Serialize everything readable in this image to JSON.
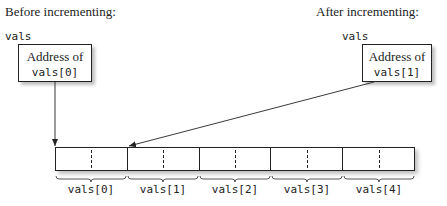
{
  "before": {
    "caption": "Before incrementing:",
    "var_name": "vals",
    "box_line1": "Address of",
    "box_line2": "vals[0]"
  },
  "after": {
    "caption": "After incrementing:",
    "var_name": "vals",
    "box_line1": "Address of",
    "box_line2": "vals[1]"
  },
  "array": {
    "elements": [
      {
        "label": "vals[0]"
      },
      {
        "label": "vals[1]"
      },
      {
        "label": "vals[2]"
      },
      {
        "label": "vals[3]"
      },
      {
        "label": "vals[4]"
      }
    ]
  },
  "colors": {
    "line": "#222222",
    "background": "#ffffff"
  }
}
